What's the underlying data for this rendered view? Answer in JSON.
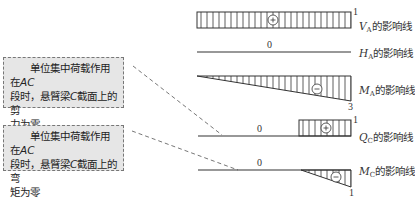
{
  "notes": [
    {
      "line1": "单位集中荷载作用在",
      "line1_em": "AC",
      "line2_pre": "段时，悬臂梁",
      "line2_em": "C",
      "line2_post": "截面上的剪",
      "line3": "力为零"
    },
    {
      "line1": "单位集中荷载作用在",
      "line1_em": "AC",
      "line2_pre": "段时，悬臂梁",
      "line2_em": "C",
      "line2_post": "截面上的弯",
      "line3": "矩为零"
    }
  ],
  "diagrams": [
    {
      "id": "VA",
      "var": "V",
      "sub": "A",
      "suffix": "的影响线",
      "sign": "+",
      "end_value": "1",
      "zero_label": ""
    },
    {
      "id": "HA",
      "var": "H",
      "sub": "A",
      "suffix": "的影响线",
      "sign": "",
      "end_value": "",
      "zero_label": "0"
    },
    {
      "id": "MA",
      "var": "M",
      "sub": "A",
      "suffix": "的影响线",
      "sign": "−",
      "end_value": "3",
      "zero_label": ""
    },
    {
      "id": "QC",
      "var": "Q",
      "sub": "C",
      "suffix": "的影响线",
      "sign": "+",
      "end_value": "1",
      "zero_label": "0"
    },
    {
      "id": "MC",
      "var": "M",
      "sub": "C",
      "suffix": "的影响线",
      "sign": "−",
      "end_value": "1",
      "zero_label": "0"
    }
  ],
  "colors": {
    "line": "#333333",
    "note_bg": "#e6e6e6",
    "dash": "#777777"
  }
}
